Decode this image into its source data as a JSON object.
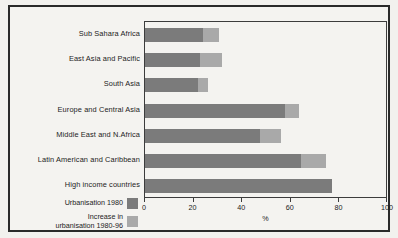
{
  "chart_data": {
    "type": "bar",
    "orientation": "horizontal",
    "stacked": true,
    "title": "",
    "xlabel": "%",
    "ylabel": "",
    "xlim": [
      0,
      100
    ],
    "xticks": [
      0,
      20,
      40,
      60,
      80,
      100
    ],
    "xticklabels": [
      "0",
      "20",
      "40",
      "60",
      "80",
      "100"
    ],
    "grid": false,
    "legend_position": "bottom-left",
    "categories": [
      "Sub Sahara Africa",
      "East Asia and Pacific",
      "South Asia",
      "Europe and Central Asia",
      "Middle East and N.Africa",
      "Latin American and Caribbean",
      "High income countries"
    ],
    "series": [
      {
        "name": "Urbanisation 1980",
        "color": "#7b7b7b",
        "values": [
          24,
          22.5,
          22,
          57.5,
          47.5,
          64,
          77
        ]
      },
      {
        "name": "Increase in\nurbanisation 1980-96",
        "color": "#a9a9a9",
        "values": [
          6.5,
          9,
          4,
          6,
          8.5,
          10.5,
          0
        ]
      }
    ],
    "totals": [
      30.5,
      31.5,
      26,
      63.5,
      56,
      74.5,
      77
    ]
  },
  "legend": {
    "items": [
      {
        "label": "Urbanisation 1980",
        "color": "#7b7b7b"
      },
      {
        "label": "Increase in\nurbanisation 1980-96",
        "color": "#a9a9a9"
      }
    ]
  },
  "axis": {
    "x_label": "%",
    "ticks": [
      "0",
      "20",
      "40",
      "60",
      "80",
      "100"
    ]
  }
}
